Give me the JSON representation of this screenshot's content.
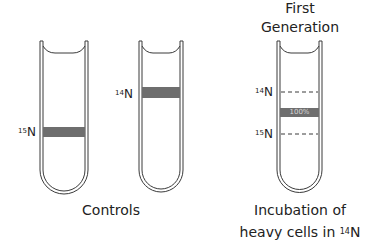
{
  "controls": {
    "caption": "Controls",
    "tubes": [
      {
        "id": "heavy-control",
        "label_sup": "15",
        "label_base": "N",
        "band": "15N"
      },
      {
        "id": "light-control",
        "label_sup": "14",
        "label_base": "N",
        "band": "14N"
      }
    ]
  },
  "first_generation": {
    "title_line1": "First",
    "title_line2": "Generation",
    "reference_labels": [
      {
        "sup": "14",
        "base": "N"
      },
      {
        "sup": "15",
        "base": "N"
      }
    ],
    "band_label": "100%",
    "caption_line1": "Incubation of",
    "caption_line2_prefix": "heavy cells in ",
    "caption_line2_sup": "14",
    "caption_line2_base": "N"
  },
  "colors": {
    "band": "#6e6e6e",
    "outline": "#3a3a3a",
    "text": "#222222"
  }
}
